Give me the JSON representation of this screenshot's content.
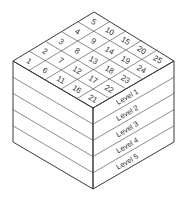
{
  "diagram": {
    "grid": {
      "rows": 5,
      "cols": 5,
      "cells": [
        [
          "1",
          "2",
          "3",
          "4",
          "5"
        ],
        [
          "6",
          "7",
          "8",
          "9",
          "10"
        ],
        [
          "11",
          "12",
          "13",
          "14",
          "15"
        ],
        [
          "16",
          "17",
          "18",
          "19",
          "20"
        ],
        [
          "21",
          "22",
          "23",
          "24",
          "25"
        ]
      ]
    },
    "levels": [
      "Level 1",
      "Level 2",
      "Level 3",
      "Level 4",
      "Level 5"
    ],
    "colors": {
      "line": "#3a3a3a",
      "text": "#333333",
      "background": "#ffffff"
    }
  }
}
